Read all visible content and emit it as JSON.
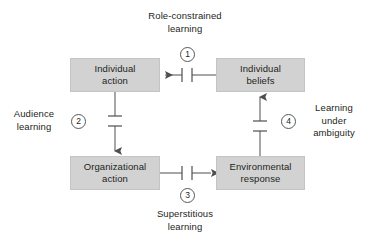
{
  "diagram": {
    "colors": {
      "box_fill": "#d2d2d2",
      "box_border": "#c4c4c4",
      "line": "#4b4f52",
      "text": "#231f20",
      "background": "#ffffff"
    },
    "nodes": [
      {
        "id": "individual-action",
        "lines": [
          "Individual",
          "action"
        ],
        "x": 70,
        "y": 58,
        "w": 90,
        "h": 34
      },
      {
        "id": "individual-beliefs",
        "lines": [
          "Individual",
          "beliefs"
        ],
        "x": 216,
        "y": 58,
        "w": 89,
        "h": 34
      },
      {
        "id": "organizational-action",
        "lines": [
          "Organizational",
          "action"
        ],
        "x": 70,
        "y": 156,
        "w": 90,
        "h": 34
      },
      {
        "id": "environmental-response",
        "lines": [
          "Environmental",
          "response"
        ],
        "x": 216,
        "y": 156,
        "w": 89,
        "h": 34
      }
    ],
    "edges": [
      {
        "id": "edge-1",
        "marker": "1",
        "from": "individual-beliefs",
        "to": "individual-action",
        "label_lines": [
          "Role-constrained",
          "learning"
        ],
        "label_position": "top"
      },
      {
        "id": "edge-2",
        "marker": "2",
        "from": "individual-action",
        "to": "organizational-action",
        "label_lines": [
          "Audience",
          "learning"
        ],
        "label_position": "left"
      },
      {
        "id": "edge-3",
        "marker": "3",
        "from": "organizational-action",
        "to": "environmental-response",
        "label_lines": [
          "Superstitious",
          "learning"
        ],
        "label_position": "bottom"
      },
      {
        "id": "edge-4",
        "marker": "4",
        "from": "environmental-response",
        "to": "individual-beliefs",
        "label_lines": [
          "Learning",
          "under",
          "ambiguity"
        ],
        "label_position": "right"
      }
    ]
  }
}
